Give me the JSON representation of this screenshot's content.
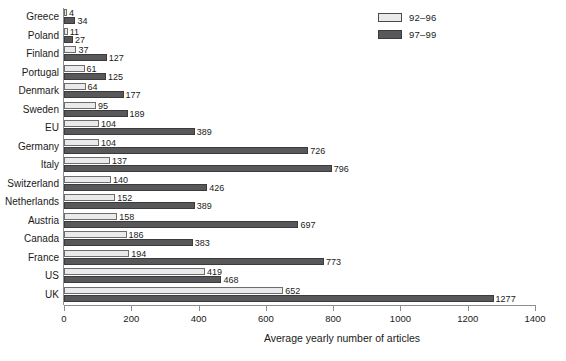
{
  "chart_data": {
    "type": "bar",
    "orientation": "horizontal",
    "title": "",
    "xlabel": "Average yearly number of articles",
    "ylabel": "",
    "xlim": [
      0,
      1400
    ],
    "xticks": [
      0,
      200,
      400,
      600,
      800,
      1000,
      1200,
      1400
    ],
    "xtick_labels": [
      "0",
      "200",
      "400",
      "600",
      "800",
      "1000",
      "1200",
      "1400"
    ],
    "grid": false,
    "legend_position": "top-right",
    "colors": {
      "series_92_96": "#eaeaea",
      "series_97_99": "#58585a",
      "axis": "#8d8d8d",
      "text": "#1a1a1a",
      "background": "#ffffff"
    },
    "categories": [
      "Greece",
      "Poland",
      "Finland",
      "Portugal",
      "Denmark",
      "Sweden",
      "EU",
      "Germany",
      "Italy",
      "Switzerland",
      "Netherlands",
      "Austria",
      "Canada",
      "France",
      "US",
      "UK"
    ],
    "series": [
      {
        "name": "92–96",
        "color": "#eaeaea",
        "values": [
          4,
          11,
          37,
          61,
          64,
          95,
          104,
          104,
          137,
          140,
          152,
          158,
          186,
          194,
          419,
          652
        ],
        "labels": [
          "4",
          "11",
          "37",
          "61",
          "64",
          "95",
          "104",
          "104",
          "137",
          "140",
          "152",
          "158",
          "186",
          "194",
          "419",
          "652"
        ]
      },
      {
        "name": "97–99",
        "color": "#58585a",
        "values": [
          34,
          27,
          127,
          125,
          177,
          189,
          389,
          726,
          796,
          426,
          389,
          697,
          383,
          773,
          468,
          1277
        ],
        "labels": [
          "34",
          "27",
          "127",
          "125",
          "177",
          "189",
          "389",
          "726",
          "796",
          "426",
          "389",
          "697",
          "383",
          "773",
          "468",
          "1277"
        ]
      }
    ]
  },
  "legend": {
    "items": [
      {
        "label": "92–96",
        "swatch": "light"
      },
      {
        "label": "97–99",
        "swatch": "dark"
      }
    ]
  }
}
